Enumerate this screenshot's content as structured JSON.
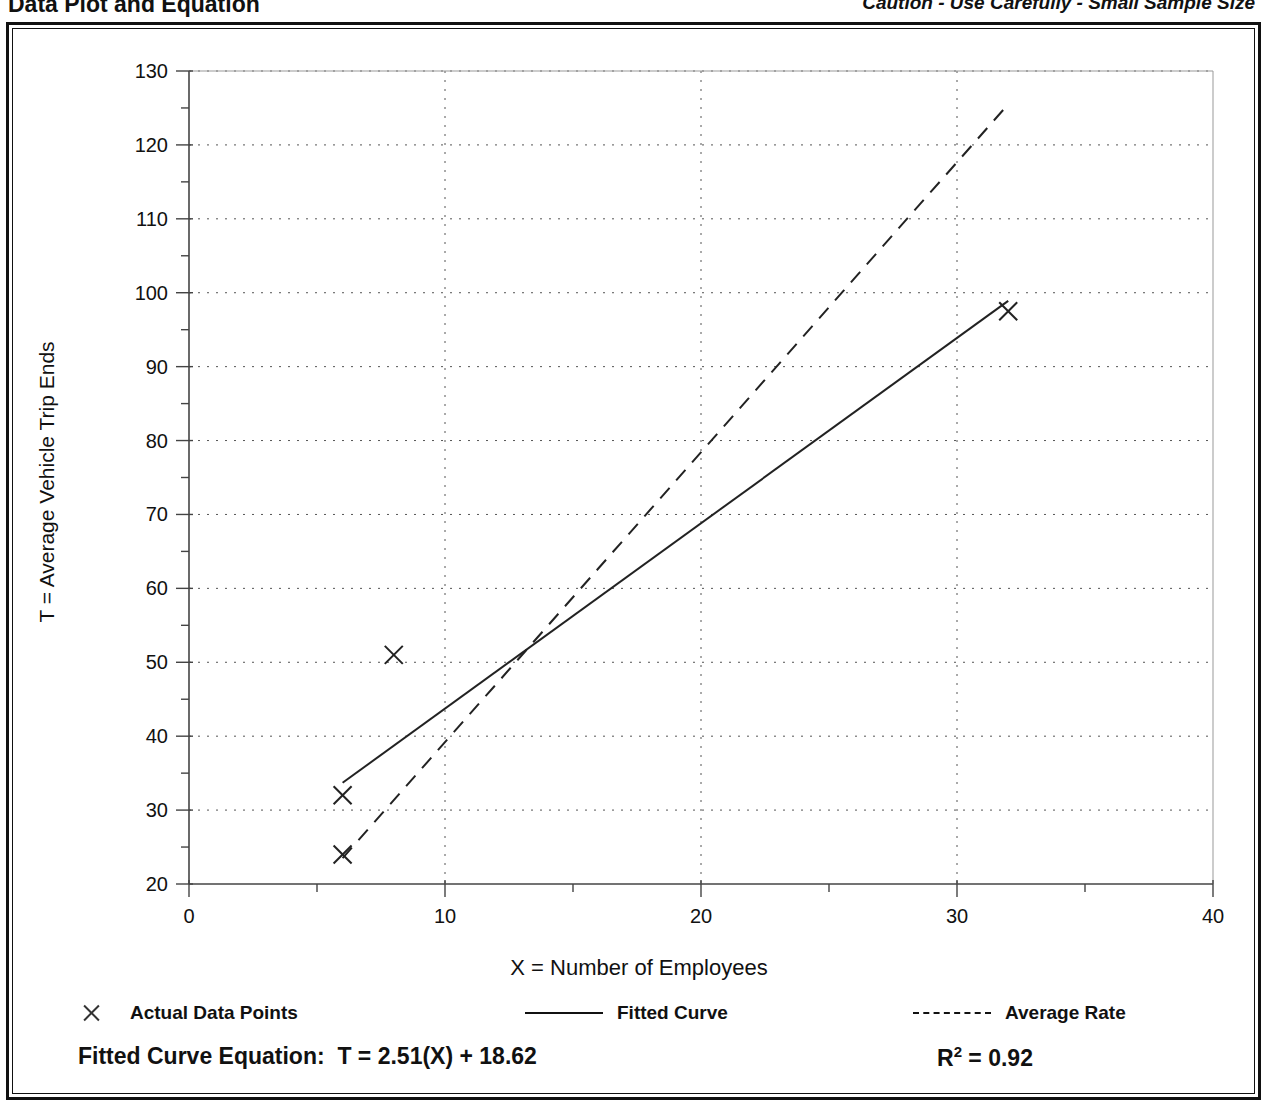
{
  "header": {
    "title": "Data Plot and Equation",
    "caution": "Caution - Use Carefully - Small Sample Size"
  },
  "legend": {
    "entries": [
      {
        "label": "Actual Data Points",
        "marker": "x-marker"
      },
      {
        "label": "Fitted Curve",
        "marker": "solid-line"
      },
      {
        "label": "Average Rate",
        "marker": "dashed-line"
      }
    ]
  },
  "footer": {
    "equation_label": "Fitted Curve Equation:",
    "equation": "T = 2.51(X) + 18.62",
    "r_squared_label": "R",
    "r_squared_exponent": "2",
    "r_squared_value": "= 0.92"
  },
  "chart_data": {
    "type": "scatter",
    "title": "Data Plot and Equation",
    "xlabel": "X = Number of Employees",
    "ylabel": "T = Average Vehicle Trip Ends",
    "xlim": [
      0,
      40
    ],
    "ylim": [
      20,
      130
    ],
    "xticks": [
      0,
      10,
      20,
      30,
      40
    ],
    "yticks": [
      20,
      30,
      40,
      50,
      60,
      70,
      80,
      90,
      100,
      110,
      120,
      130
    ],
    "x_minor_tick_step": 5,
    "y_minor_tick_step": 5,
    "grid": "dotted-major-both",
    "legend_position": "below-axes",
    "series": [
      {
        "name": "Actual Data Points",
        "type": "scatter",
        "marker": "x",
        "points": [
          {
            "x": 6,
            "y": 24
          },
          {
            "x": 6,
            "y": 32
          },
          {
            "x": 8,
            "y": 51
          },
          {
            "x": 32,
            "y": 97.5
          }
        ]
      },
      {
        "name": "Fitted Curve",
        "type": "line",
        "style": "solid",
        "equation": "T = 2.51(X) + 18.62",
        "r_squared": 0.92,
        "endpoints": [
          {
            "x": 6,
            "y": 33.7
          },
          {
            "x": 32,
            "y": 98.9
          }
        ]
      },
      {
        "name": "Average Rate",
        "type": "line",
        "style": "dashed",
        "endpoints": [
          {
            "x": 6,
            "y": 23.5
          },
          {
            "x": 32,
            "y": 125.5
          }
        ]
      }
    ]
  }
}
